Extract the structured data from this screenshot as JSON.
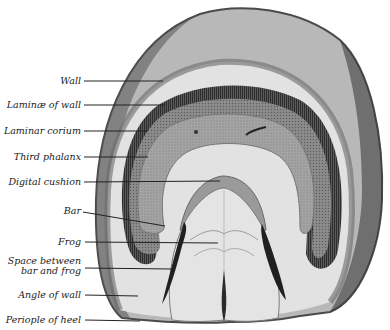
{
  "figure": {
    "colors": {
      "background": "#ffffff",
      "wall_outer": "#6e6e6e",
      "wall_body": "#b4b4b4",
      "laminae": "#4a4a4a",
      "corium": "#8a8a8a",
      "phalanx": "#a8a8a8",
      "white_band": "#e8e8e8",
      "frog": "#dcdcdc",
      "cleft": "#262626",
      "leader_line": "#222222"
    }
  },
  "labels": [
    {
      "id": "wall",
      "text": "Wall",
      "line": [
        84,
        81,
        163,
        81
      ]
    },
    {
      "id": "laminae-of-wall",
      "text": "Laminæ of wall",
      "line": [
        84,
        105,
        165,
        105
      ]
    },
    {
      "id": "laminar-corium",
      "text": "Laminar corium",
      "line": [
        84,
        131,
        148,
        131
      ]
    },
    {
      "id": "third-phalanx",
      "text": "Third phalanx",
      "line": [
        84,
        157,
        148,
        157
      ]
    },
    {
      "id": "digital-cushion",
      "text": "Digital cushion",
      "line": [
        84,
        182,
        220,
        181
      ]
    },
    {
      "id": "bar",
      "text": "Bar",
      "line": [
        83,
        212,
        165,
        226
      ]
    },
    {
      "id": "frog",
      "text": "Frog",
      "line": [
        85,
        242,
        218,
        243
      ]
    },
    {
      "id": "space-between-bar-and-frog",
      "text": "Space between",
      "text2": "bar and frog",
      "line": [
        85,
        268,
        172,
        269
      ]
    },
    {
      "id": "angle-of-wall",
      "text": "Angle of wall",
      "line": [
        85,
        295,
        138,
        296
      ]
    },
    {
      "id": "periople-of-heel",
      "text": "Periople of heel",
      "line": [
        85,
        320,
        140,
        321
      ]
    }
  ]
}
